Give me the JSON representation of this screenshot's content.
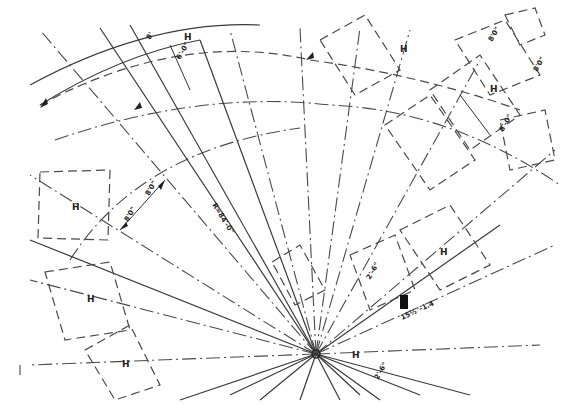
{
  "drawing": {
    "type": "engineering-plan",
    "description": "Radial layout drawing with center lines converging on a focal point",
    "focal_point": {
      "x": 316,
      "y": 354
    },
    "line_color": "#3a3a3a",
    "background": "#ffffff"
  },
  "labels": {
    "radius_label": "R=84'-0\"",
    "dim_top_left": "6'-0\"",
    "dim_8_a": "8'0\"",
    "dim_8_b": "8'0\"",
    "dim_right_a": "8'0\"",
    "dim_right_b": "8'0\"",
    "dim_right_box": "8'-0\"",
    "dim_center_small": "2'-6\"",
    "dim_bottom_small": "2'-6\"",
    "angle_label": "15½°-1.4",
    "top_left_small": "8'"
  },
  "markers": {
    "h_marks": [
      "H",
      "H",
      "H",
      "H",
      "H",
      "H",
      "H",
      "H"
    ]
  }
}
